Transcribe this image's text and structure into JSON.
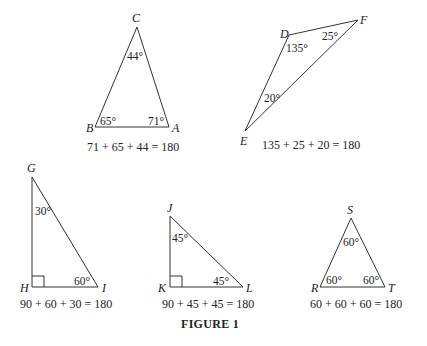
{
  "figure": {
    "caption": "FIGURE 1",
    "triangles": [
      {
        "id": "ABC",
        "vertices": {
          "C": "C",
          "B": "B",
          "A": "A"
        },
        "angles": {
          "C": "44°",
          "B": "65°",
          "A": "71°"
        },
        "equation": "71 + 65 + 44 = 180"
      },
      {
        "id": "DEF",
        "vertices": {
          "D": "D",
          "E": "E",
          "F": "F"
        },
        "angles": {
          "D": "135°",
          "F": "25°",
          "E": "20°"
        },
        "equation": "135 + 25 + 20 = 180"
      },
      {
        "id": "GHI",
        "vertices": {
          "G": "G",
          "H": "H",
          "I": "I"
        },
        "angles": {
          "G": "30°",
          "I": "60°",
          "H": "right angle"
        },
        "equation": "90 + 60 + 30 = 180"
      },
      {
        "id": "JKL",
        "vertices": {
          "J": "J",
          "K": "K",
          "L": "L"
        },
        "angles": {
          "J": "45°",
          "L": "45°",
          "K": "right angle"
        },
        "equation": "90 + 45 + 45 = 180"
      },
      {
        "id": "RST",
        "vertices": {
          "R": "R",
          "S": "S",
          "T": "T"
        },
        "angles": {
          "S": "60°",
          "R": "60°",
          "T": "60°"
        },
        "equation": "60 + 60 + 60 = 180"
      }
    ]
  }
}
